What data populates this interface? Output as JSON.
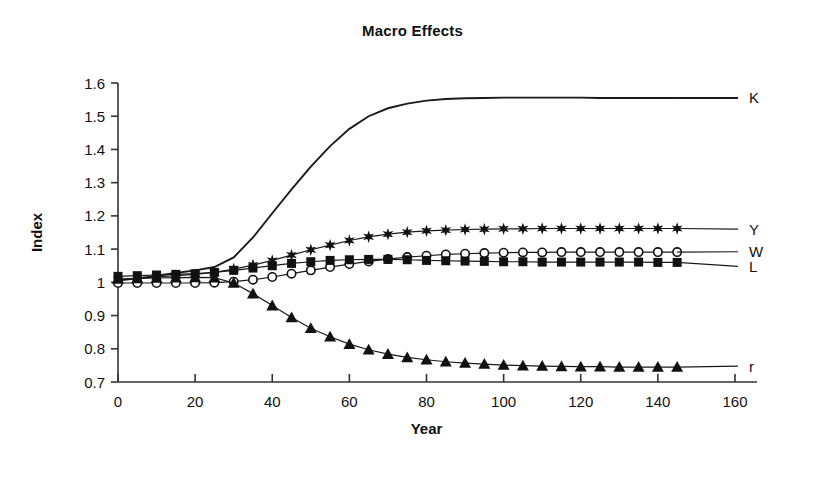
{
  "chart_data": {
    "type": "line",
    "title": "Macro Effects",
    "xlabel": "Year",
    "ylabel": "Index",
    "xlim": [
      0,
      160
    ],
    "ylim": [
      0.7,
      1.6
    ],
    "xticks": [
      0,
      20,
      40,
      60,
      80,
      100,
      120,
      140,
      160
    ],
    "xtick_labels": [
      "0",
      "20",
      "40",
      "60",
      "80",
      "100",
      "120",
      "140",
      "160"
    ],
    "yticks": [
      0.7,
      0.8,
      0.9,
      1,
      1.1,
      1.2,
      1.3,
      1.4,
      1.5,
      1.6
    ],
    "ytick_labels": [
      "0.7",
      "0.8",
      "0.9",
      "1",
      "1.1",
      "1.2",
      "1.3",
      "1.4",
      "1.5",
      "1.6"
    ],
    "grid": false,
    "legend_position": "right-inline",
    "x": [
      0,
      5,
      10,
      15,
      20,
      25,
      30,
      35,
      40,
      45,
      50,
      55,
      60,
      65,
      70,
      75,
      80,
      85,
      90,
      95,
      100,
      105,
      110,
      115,
      120,
      125,
      130,
      135,
      140,
      145
    ],
    "series": [
      {
        "name": "K",
        "label": "K",
        "marker": "none",
        "color": "#1a1a1a",
        "label_y": 1.555,
        "values": [
          1.005,
          1.012,
          1.02,
          1.028,
          1.036,
          1.046,
          1.075,
          1.135,
          1.208,
          1.28,
          1.348,
          1.41,
          1.462,
          1.5,
          1.524,
          1.538,
          1.547,
          1.552,
          1.554,
          1.555,
          1.556,
          1.556,
          1.556,
          1.556,
          1.556,
          1.555,
          1.555,
          1.555,
          1.555,
          1.555
        ]
      },
      {
        "name": "Y",
        "label": "Y",
        "marker": "star",
        "color": "#1a1a1a",
        "label_y": 1.16,
        "values": [
          1.008,
          1.012,
          1.016,
          1.02,
          1.024,
          1.03,
          1.04,
          1.052,
          1.066,
          1.082,
          1.098,
          1.112,
          1.126,
          1.137,
          1.145,
          1.151,
          1.155,
          1.157,
          1.159,
          1.16,
          1.161,
          1.161,
          1.162,
          1.162,
          1.162,
          1.162,
          1.162,
          1.162,
          1.162,
          1.162
        ]
      },
      {
        "name": "W",
        "label": "W",
        "marker": "circle",
        "color": "#1a1a1a",
        "label_y": 1.092,
        "values": [
          0.998,
          0.998,
          0.998,
          0.998,
          0.998,
          0.999,
          1.002,
          1.008,
          1.016,
          1.026,
          1.036,
          1.046,
          1.055,
          1.063,
          1.07,
          1.076,
          1.08,
          1.084,
          1.086,
          1.088,
          1.089,
          1.09,
          1.09,
          1.091,
          1.091,
          1.091,
          1.091,
          1.091,
          1.091,
          1.091
        ]
      },
      {
        "name": "L",
        "label": "L",
        "marker": "square",
        "color": "#1a1a1a",
        "label_y": 1.048,
        "values": [
          1.018,
          1.02,
          1.022,
          1.024,
          1.026,
          1.03,
          1.036,
          1.043,
          1.05,
          1.057,
          1.062,
          1.066,
          1.068,
          1.069,
          1.069,
          1.068,
          1.066,
          1.065,
          1.064,
          1.063,
          1.062,
          1.062,
          1.061,
          1.061,
          1.061,
          1.061,
          1.061,
          1.061,
          1.06,
          1.06
        ]
      },
      {
        "name": "r",
        "label": "r",
        "marker": "triangle",
        "color": "#1a1a1a",
        "label_y": 0.748,
        "values": [
          1.01,
          1.012,
          1.013,
          1.014,
          1.015,
          1.014,
          0.998,
          0.966,
          0.93,
          0.894,
          0.862,
          0.836,
          0.814,
          0.797,
          0.784,
          0.774,
          0.767,
          0.761,
          0.757,
          0.754,
          0.751,
          0.749,
          0.748,
          0.747,
          0.746,
          0.746,
          0.745,
          0.745,
          0.745,
          0.745
        ]
      }
    ]
  }
}
